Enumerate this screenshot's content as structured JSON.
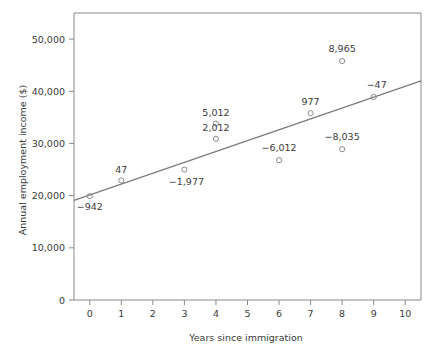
{
  "chart_data": {
    "type": "scatter",
    "title": "",
    "xlabel": "Years since immigration",
    "ylabel": "Annual employment income ($)",
    "xlim": [
      -0.5,
      10.5
    ],
    "ylim": [
      0,
      55000
    ],
    "grid": false,
    "legend": "none",
    "x_ticks": [
      "0",
      "1",
      "2",
      "3",
      "4",
      "5",
      "6",
      "7",
      "8",
      "9",
      "10"
    ],
    "x_tick_values": [
      0,
      1,
      2,
      3,
      4,
      5,
      6,
      7,
      8,
      9,
      10
    ],
    "y_ticks": [
      "0",
      "10,000",
      "20,000",
      "30,000",
      "40,000",
      "50,000"
    ],
    "y_tick_values": [
      0,
      10000,
      20000,
      30000,
      40000,
      50000
    ],
    "points": [
      {
        "x": 0,
        "y": 19900,
        "label": "−942",
        "label_dx": 0,
        "label_dy": 14,
        "anchor": "middle"
      },
      {
        "x": 1,
        "y": 22900,
        "label": "47",
        "label_dx": 0,
        "label_dy": -8,
        "anchor": "middle"
      },
      {
        "x": 3,
        "y": 25000,
        "label": "−1,977",
        "label_dx": 2,
        "label_dy": 15,
        "anchor": "middle"
      },
      {
        "x": 4,
        "y": 33800,
        "label": "5,012",
        "label_dx": 0,
        "label_dy": -8,
        "anchor": "middle"
      },
      {
        "x": 4,
        "y": 30900,
        "label": "2,012",
        "label_dx": 0,
        "label_dy": -8,
        "anchor": "middle"
      },
      {
        "x": 6,
        "y": 26800,
        "label": "−6,012",
        "label_dx": 0,
        "label_dy": -9,
        "anchor": "middle"
      },
      {
        "x": 7,
        "y": 35800,
        "label": "977",
        "label_dx": 0,
        "label_dy": -8,
        "anchor": "middle"
      },
      {
        "x": 8,
        "y": 45800,
        "label": "8,965",
        "label_dx": 0,
        "label_dy": -9,
        "anchor": "middle"
      },
      {
        "x": 8,
        "y": 28900,
        "label": "−8,035",
        "label_dx": 0,
        "label_dy": -9,
        "anchor": "middle"
      },
      {
        "x": 9,
        "y": 38900,
        "label": "−47",
        "label_dx": 3,
        "label_dy": -9,
        "anchor": "middle"
      }
    ],
    "fit_line": {
      "name": "regression line",
      "x_start": -0.5,
      "y_start": 19100,
      "x_end": 10.5,
      "y_end": 42000
    },
    "colors": {
      "line": "#7a7a7a",
      "marker": "#8a8a8a",
      "axis": "#8a8a8a",
      "text": "#3a3a3a",
      "background": "#ffffff"
    }
  }
}
